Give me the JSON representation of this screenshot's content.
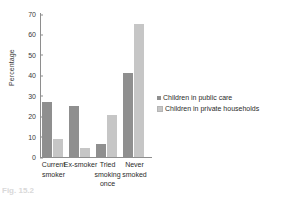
{
  "chart_data": {
    "type": "bar",
    "title": "",
    "xlabel": "",
    "ylabel": "Percentage",
    "ylim": [
      0,
      70
    ],
    "yticks": [
      0,
      10,
      20,
      30,
      40,
      50,
      60,
      70
    ],
    "grid": false,
    "legend_position": "right",
    "categories": [
      "Current smoker",
      "Ex-smoker",
      "Tried smoking once",
      "Never smoked"
    ],
    "category_lines": [
      [
        "Current",
        "smoker"
      ],
      [
        "Ex-smoker"
      ],
      [
        "Tried",
        "smoking",
        "once"
      ],
      [
        "Never",
        "smoked"
      ]
    ],
    "series": [
      {
        "name": "Children in public care",
        "color": "#8f8f8f",
        "values": [
          27,
          25,
          6.5,
          41
        ]
      },
      {
        "name": "Children in private households",
        "color": "#c6c6c6",
        "values": [
          9,
          4.5,
          20.5,
          65
        ]
      }
    ]
  },
  "figure": {
    "caption_remnant": "Fig. 15.2"
  }
}
